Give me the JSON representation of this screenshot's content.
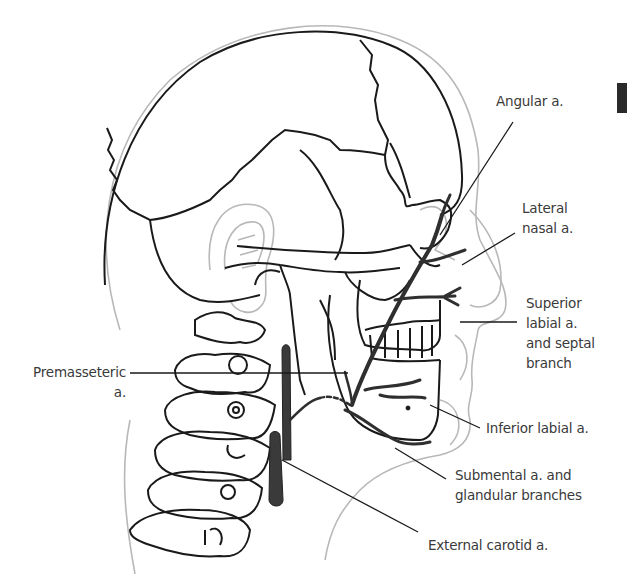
{
  "figure": {
    "colors": {
      "bone_outline": "#1a1a1a",
      "skin_outline": "#b5b5b5",
      "artery_fill": "#3a3a3a",
      "leader_line": "#1a1a1a",
      "label_text": "#3a3a3a"
    },
    "labels": {
      "angular": "Angular a.",
      "lateral_nasal_1": "Lateral",
      "lateral_nasal_2": "nasal a.",
      "superior_labial_1": "Superior",
      "superior_labial_2": "labial a.",
      "superior_labial_3": "and septal",
      "superior_labial_4": "branch",
      "premasseteric_1": "Premasseteric",
      "premasseteric_2": "a.",
      "inferior_labial": "Inferior labial a.",
      "submental_1": "Submental a. and",
      "submental_2": "glandular branches",
      "external_carotid": "External carotid a."
    }
  }
}
